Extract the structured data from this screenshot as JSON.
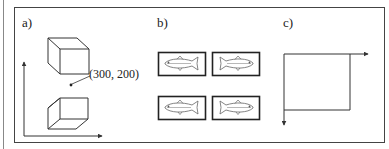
{
  "figure": {
    "panels": [
      {
        "id": "a",
        "label": "a)",
        "annotation": "(300, 200)"
      },
      {
        "id": "b",
        "label": "b)",
        "items": [
          "fish-right",
          "fish-left",
          "fish-right",
          "fish-left"
        ]
      },
      {
        "id": "c",
        "label": "c)"
      }
    ],
    "colors": {
      "stroke": "#333333",
      "background": "#ffffff"
    }
  }
}
